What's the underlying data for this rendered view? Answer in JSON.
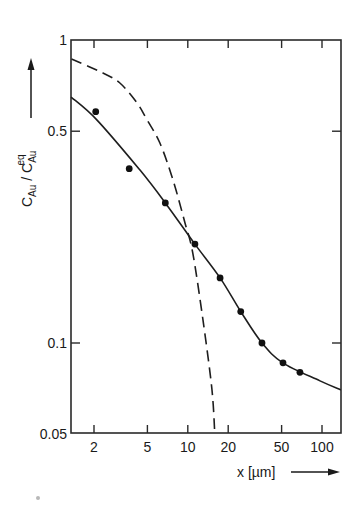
{
  "chart_data": {
    "type": "scatter",
    "title": "",
    "xlabel": "x [µm]",
    "ylabel": "C_Au / C_Au^eq",
    "xscale": "log",
    "yscale": "log",
    "xlim": [
      1.35,
      138
    ],
    "ylim": [
      0.05,
      1
    ],
    "xticks": [
      2,
      5,
      10,
      20,
      50,
      100
    ],
    "xtick_labels": [
      "2",
      "5",
      "10",
      "20",
      "50",
      "100"
    ],
    "yticks": [
      1,
      0.5,
      0.1,
      0.05
    ],
    "ytick_labels": [
      "1",
      "0.5",
      "0.1",
      "0.05"
    ],
    "grid": false,
    "legend": null,
    "series": [
      {
        "name": "measured",
        "style": "points",
        "x": [
          2.06,
          3.66,
          6.8,
          11.3,
          17.4,
          24.8,
          35.7,
          51.2,
          68.5
        ],
        "y": [
          0.58,
          0.376,
          0.29,
          0.212,
          0.164,
          0.127,
          0.1,
          0.086,
          0.08
        ]
      },
      {
        "name": "solid curve",
        "style": "solid",
        "x": [
          1.35,
          2.1,
          4.4,
          6.8,
          11.3,
          17.4,
          24.8,
          35.7,
          51,
          96.6,
          138
        ],
        "y": [
          0.648,
          0.545,
          0.372,
          0.29,
          0.212,
          0.164,
          0.127,
          0.1,
          0.086,
          0.075,
          0.07
        ]
      },
      {
        "name": "dashed curve",
        "style": "dashed",
        "x": [
          1.36,
          2.33,
          3.12,
          4.18,
          4.97,
          6.2,
          7.76,
          9.53,
          10.9,
          12.97,
          15.1,
          15.9
        ],
        "y": [
          0.866,
          0.778,
          0.721,
          0.62,
          0.545,
          0.457,
          0.345,
          0.249,
          0.198,
          0.119,
          0.071,
          0.05
        ]
      }
    ]
  },
  "labels": {
    "y_axis": {
      "c1": "C",
      "sub1": "Au",
      "slash": " / ",
      "c2": "C",
      "sub2": "Au",
      "sup2": "eq"
    },
    "x_axis": "x [µm]"
  },
  "style": {
    "ink": "#1e1e1e",
    "background": "#ffffff"
  }
}
